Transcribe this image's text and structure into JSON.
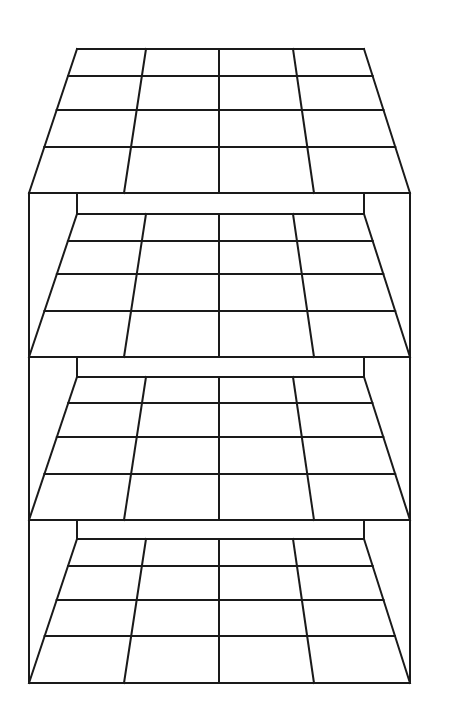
{
  "diagram": {
    "title": "",
    "type": "stacked perspective grid layers",
    "stroke_color": "#1a1a1a",
    "background": "#ffffff",
    "stroke_width": 2,
    "frame": {
      "outer_left_x": 29,
      "outer_right_x": 410,
      "inner_left_x": 77,
      "inner_right_x": 364,
      "top_y": 193,
      "bottom_y": 683
    },
    "grid": {
      "columns": 4,
      "rows": 4,
      "back_column_xs": [
        77,
        146,
        219,
        293,
        364
      ],
      "front_column_xs": [
        29,
        124,
        219,
        314,
        410
      ],
      "row_fractions": [
        0.1875,
        0.42,
        0.68
      ]
    },
    "layers": [
      {
        "name": "layer-1",
        "top_y": 49,
        "bottom_y": 193,
        "row_ys": [
          76,
          110,
          147
        ]
      },
      {
        "name": "layer-2",
        "top_y": 214,
        "bottom_y": 357,
        "row_ys": [
          241,
          274,
          311
        ]
      },
      {
        "name": "layer-3",
        "top_y": 377,
        "bottom_y": 520,
        "row_ys": [
          403,
          437,
          474
        ]
      },
      {
        "name": "layer-4",
        "top_y": 539,
        "bottom_y": 683,
        "row_ys": [
          566,
          600,
          636
        ]
      }
    ],
    "back_wall_stubs": [
      {
        "top_y": 193,
        "bottom_y": 214
      },
      {
        "top_y": 357,
        "bottom_y": 377
      },
      {
        "top_y": 520,
        "bottom_y": 539
      }
    ]
  }
}
